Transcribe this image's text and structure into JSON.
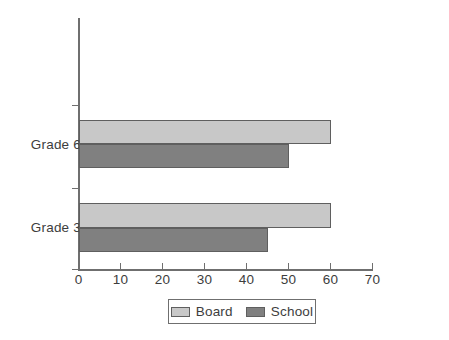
{
  "chart_data": {
    "type": "bar",
    "orientation": "horizontal",
    "title": "",
    "xlabel": "",
    "ylabel": "",
    "categories": [
      "Grade 6",
      "Grade 3"
    ],
    "series": [
      {
        "name": "Board",
        "color": "#c8c8c8",
        "values": [
          60,
          60
        ]
      },
      {
        "name": "School",
        "color": "#808080",
        "values": [
          50,
          45
        ]
      }
    ],
    "xlim": [
      0,
      70
    ],
    "xticks": [
      0,
      10,
      20,
      30,
      40,
      50,
      60,
      70
    ],
    "xtick_labels": [
      "0",
      "10",
      "20",
      "30",
      "40",
      "50",
      "60",
      "70"
    ],
    "grid": false,
    "legend_position": "bottom-center",
    "legend_entries": [
      "Board",
      "School"
    ],
    "axis_color": "#6f6f6f",
    "bar_border_color": "#5f5f5f",
    "background": "#ffffff"
  },
  "axis": {
    "tick_labels": [
      "0",
      "10",
      "20",
      "30",
      "40",
      "50",
      "60",
      "70"
    ]
  },
  "categories": {
    "grade6": "Grade 6",
    "grade3": "Grade 3"
  },
  "legend": {
    "board": "Board",
    "school": "School"
  }
}
